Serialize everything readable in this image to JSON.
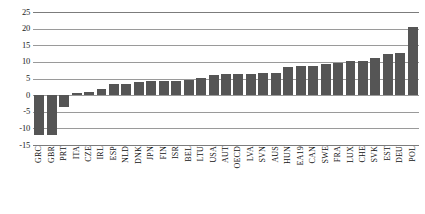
{
  "chart_data": {
    "type": "bar",
    "title": "",
    "subtitle": "",
    "xlabel": "",
    "ylabel": "",
    "ylim": [
      -15,
      25
    ],
    "ytick_values": [
      25,
      20,
      15,
      10,
      5,
      0,
      -5,
      -10,
      -15
    ],
    "ytick_labels": [
      "25",
      "20",
      "15",
      "10",
      "5",
      "0",
      "-5",
      "-10",
      "-15"
    ],
    "grid": true,
    "legend": "none",
    "bar_color": "#555555",
    "categories": [
      "GRC",
      "GBR",
      "PRT",
      "ITA",
      "CZE",
      "IRL",
      "ESP",
      "NLD",
      "DNK",
      "JPN",
      "FIN",
      "ISR",
      "BEL",
      "LTU",
      "USA",
      "AUT",
      "OECD",
      "LVA",
      "SVN",
      "AUS",
      "HUN",
      "EA19",
      "CAN",
      "SWE",
      "FRA",
      "LUX",
      "CHE",
      "SVK",
      "EST",
      "DEU",
      "POL"
    ],
    "values": [
      -12.0,
      -12.0,
      -3.6,
      0.7,
      1.0,
      1.7,
      3.2,
      3.4,
      3.9,
      4.2,
      4.2,
      4.3,
      4.4,
      5.1,
      6.0,
      6.3,
      6.3,
      6.3,
      6.6,
      6.7,
      8.5,
      8.8,
      8.8,
      9.3,
      9.7,
      10.2,
      10.4,
      11.2,
      12.4,
      12.7,
      20.4
    ],
    "series": [
      {
        "name": "value",
        "values": [
          -12.0,
          -12.0,
          -3.6,
          0.7,
          1.0,
          1.7,
          3.2,
          3.4,
          3.9,
          4.2,
          4.2,
          4.3,
          4.4,
          5.1,
          6.0,
          6.3,
          6.3,
          6.3,
          6.6,
          6.7,
          8.5,
          8.8,
          8.8,
          9.3,
          9.7,
          10.2,
          10.4,
          11.2,
          12.4,
          12.7,
          20.4
        ]
      }
    ]
  }
}
